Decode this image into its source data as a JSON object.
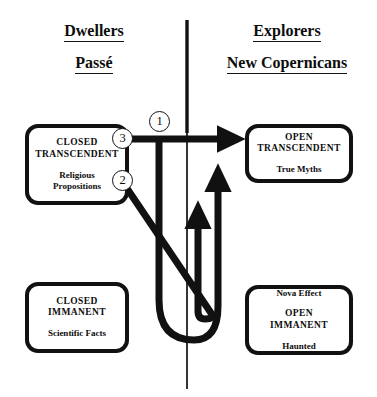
{
  "diagram": {
    "divider": {
      "name": "vertical-divider"
    },
    "columns": {
      "left": {
        "heading_primary": "Dwellers",
        "heading_secondary": "Passé"
      },
      "right": {
        "heading_primary": "Explorers",
        "heading_secondary": "New Copernicans"
      }
    },
    "boxes": [
      {
        "id": "closed-transcendent",
        "title": "CLOSED\nTRANSCENDENT",
        "subtitle": "Religious\nPropositions",
        "title_position": "top"
      },
      {
        "id": "closed-immanent",
        "title": "CLOSED\nIMMANENT",
        "subtitle": "Scientific Facts",
        "title_position": "top"
      },
      {
        "id": "open-transcendent",
        "title": "OPEN\nTRANSCENDENT",
        "subtitle": "True Myths",
        "title_position": "top"
      },
      {
        "id": "open-immanent",
        "title": "OPEN\nIMMANENT",
        "subtitle_above": "Nova Effect",
        "subtitle_below": "Haunted",
        "title_position": "middle"
      }
    ],
    "markers": [
      {
        "id": "marker-1",
        "label": "1"
      },
      {
        "id": "marker-2",
        "label": "2"
      },
      {
        "id": "marker-3",
        "label": "3"
      }
    ],
    "colors": {
      "ink": "#111111",
      "background": "#ffffff"
    }
  }
}
